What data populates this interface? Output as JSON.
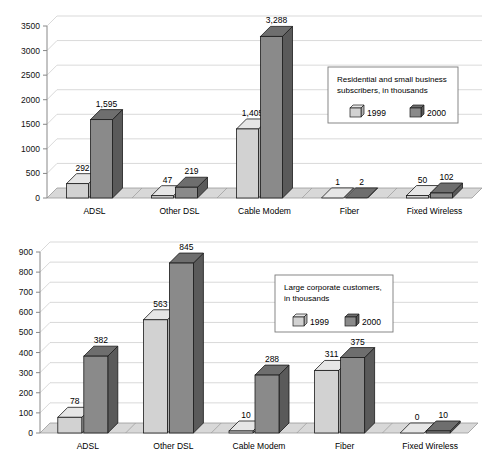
{
  "chart_data": [
    {
      "id": "residential",
      "type": "bar",
      "title": "Residential and small business subscribers, in thousands",
      "title_lines": [
        "Residential and small business",
        "subscribers, in thousands"
      ],
      "xlabel": "",
      "ylabel": "",
      "ylim": [
        0,
        3500
      ],
      "yticks": [
        0,
        500,
        1000,
        1500,
        2000,
        2500,
        3000,
        3500
      ],
      "ytick_labels": [
        "0",
        "500",
        "1000",
        "1500",
        "2000",
        "2500",
        "3000",
        "3500"
      ],
      "grid": true,
      "legend_position": "upper right",
      "categories": [
        "ADSL",
        "Other DSL",
        "Cable Modem",
        "Fiber",
        "Fixed Wireless"
      ],
      "series": [
        {
          "name": "1999",
          "color": "#d2d2d2",
          "values": [
            292,
            47,
            1405,
            1,
            50
          ],
          "labels": [
            "292",
            "47",
            "1,405",
            "1",
            "50"
          ]
        },
        {
          "name": "2000",
          "color": "#8a8a8a",
          "values": [
            1595,
            219,
            3288,
            2,
            102
          ],
          "labels": [
            "1,595",
            "219",
            "3,288",
            "2",
            "102"
          ]
        }
      ]
    },
    {
      "id": "corporate",
      "type": "bar",
      "title": "Large corporate customers, in thousands",
      "title_lines": [
        "Large corporate customers,",
        "in thousands"
      ],
      "xlabel": "",
      "ylabel": "",
      "ylim": [
        0,
        900
      ],
      "yticks": [
        0,
        100,
        200,
        300,
        400,
        500,
        600,
        700,
        800,
        900
      ],
      "ytick_labels": [
        "0",
        "100",
        "200",
        "300",
        "400",
        "500",
        "600",
        "700",
        "800",
        "900"
      ],
      "grid": true,
      "legend_position": "upper right",
      "categories": [
        "ADSL",
        "Other DSL",
        "Cable Modem",
        "Fiber",
        "Fixed Wireless"
      ],
      "series": [
        {
          "name": "1999",
          "color": "#d2d2d2",
          "values": [
            78,
            563,
            10,
            311,
            0
          ],
          "labels": [
            "78",
            "563",
            "10",
            "311",
            "0"
          ]
        },
        {
          "name": "2000",
          "color": "#8a8a8a",
          "values": [
            382,
            845,
            288,
            375,
            10
          ],
          "labels": [
            "382",
            "845",
            "288",
            "375",
            "10"
          ]
        }
      ]
    }
  ],
  "style": {
    "floor_fill": "#d8d8d8",
    "series_1999_front": "#d2d2d2",
    "series_1999_side": "#b0b0b0",
    "series_1999_top": "#e6e6e6",
    "series_2000_front": "#8a8a8a",
    "series_2000_side": "#5a5a5a",
    "series_2000_top": "#6e6e6e",
    "grid_color": "#c8c8c8",
    "axis_color": "#888888",
    "outline_color": "#1a1a1a",
    "legend_border": "#7a7a7a",
    "background": "#ffffff"
  }
}
